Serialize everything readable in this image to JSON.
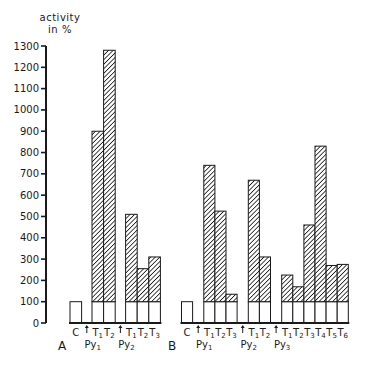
{
  "chart_data": {
    "type": "bar",
    "title": "",
    "ylabel": "activity in %",
    "xlabel": "",
    "ylim": [
      0,
      1300
    ],
    "yticks": [
      0,
      100,
      200,
      300,
      400,
      500,
      600,
      700,
      800,
      900,
      1000,
      1100,
      1200,
      1300
    ],
    "grid": false,
    "legend": null,
    "stacked_note": "Each treated bar has a white base of 100% (control level) with the hatched segment above it representing activity above control.",
    "colors": {
      "axis": "#1a1a1a",
      "bar_fill": "#ffffff",
      "hatch": "#1a1a1a"
    },
    "panels": [
      {
        "label": "A",
        "groups": [
          {
            "label": "",
            "bars": [
              {
                "label": "C",
                "value": 100,
                "hatched": false
              }
            ]
          },
          {
            "label": "Py1",
            "arrow": true,
            "bars": [
              {
                "label": "T1",
                "value": 900,
                "hatched": true
              },
              {
                "label": "T2",
                "value": 1280,
                "hatched": true
              }
            ]
          },
          {
            "label": "Py2",
            "arrow": true,
            "bars": [
              {
                "label": "T1",
                "value": 510,
                "hatched": true
              },
              {
                "label": "T2",
                "value": 255,
                "hatched": true
              },
              {
                "label": "T3",
                "value": 310,
                "hatched": true
              }
            ]
          }
        ]
      },
      {
        "label": "B",
        "groups": [
          {
            "label": "",
            "bars": [
              {
                "label": "C",
                "value": 100,
                "hatched": false
              }
            ]
          },
          {
            "label": "Py1",
            "arrow": true,
            "bars": [
              {
                "label": "T1",
                "value": 740,
                "hatched": true
              },
              {
                "label": "T2",
                "value": 525,
                "hatched": true
              },
              {
                "label": "T3",
                "value": 135,
                "hatched": true
              }
            ]
          },
          {
            "label": "Py2",
            "arrow": true,
            "bars": [
              {
                "label": "T1",
                "value": 670,
                "hatched": true
              },
              {
                "label": "T2",
                "value": 310,
                "hatched": true
              }
            ]
          },
          {
            "label": "Py3",
            "arrow": true,
            "bars": [
              {
                "label": "T1",
                "value": 225,
                "hatched": true
              },
              {
                "label": "T2",
                "value": 170,
                "hatched": true
              },
              {
                "label": "T3",
                "value": 460,
                "hatched": true
              },
              {
                "label": "T4",
                "value": 830,
                "hatched": true
              },
              {
                "label": "T5",
                "value": 270,
                "hatched": true
              },
              {
                "label": "T6",
                "value": 275,
                "hatched": true
              }
            ]
          }
        ]
      }
    ]
  },
  "axis": {
    "ylabel_line1": "activity",
    "ylabel_line2": "in %"
  },
  "panel_labels": {
    "a": "A",
    "b": "B"
  }
}
